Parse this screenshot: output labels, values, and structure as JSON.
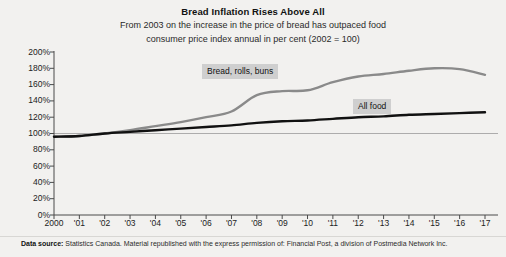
{
  "header": {
    "title": "Bread Inflation Rises Above All",
    "subtitle_line1": "From 2003 on the increase in the price of bread has outpaced food",
    "subtitle_line2": "consumer price index annual in per cent (2002 = 100)"
  },
  "footer": {
    "source_label": "Data source:",
    "source_text": " Statistics Canada. Material republished with the express permission of: Financial Post, a division of Postmedia Network Inc."
  },
  "labels": {
    "bread": "Bread, rolls, buns",
    "all_food": "All food"
  },
  "colors": {
    "background": "#f2f1ef",
    "bread_line": "#8a8a8a",
    "all_food_line": "#111111",
    "axis": "#4a4a4a",
    "gridline": "#9a9a9a",
    "label_box": "#cfcfcf",
    "text": "#1a1a1a"
  },
  "chart_data": {
    "type": "line",
    "title": "Bread Inflation Rises Above All",
    "subtitle": "From 2003 on the increase in the price of bread has outpaced food consumer price index annual in per cent (2002 = 100)",
    "xlabel": "",
    "ylabel": "",
    "xlim": [
      2000,
      2017
    ],
    "ylim": [
      0,
      200
    ],
    "ytick_values": [
      0,
      20,
      40,
      60,
      80,
      100,
      120,
      140,
      160,
      180,
      200
    ],
    "ytick_labels": [
      "0%",
      "20%",
      "40%",
      "60%",
      "80%",
      "100%",
      "120%",
      "140%",
      "160%",
      "180%",
      "200%"
    ],
    "x": [
      2000,
      2001,
      2002,
      2003,
      2004,
      2005,
      2006,
      2007,
      2008,
      2009,
      2010,
      2011,
      2012,
      2013,
      2014,
      2015,
      2016,
      2017
    ],
    "xtick_labels": [
      "2000",
      "'01",
      "'02",
      "'03",
      "'04",
      "'05",
      "'06",
      "'07",
      "'08",
      "'09",
      "'10",
      "'11",
      "'12",
      "'13",
      "'14",
      "'15",
      "'16",
      "'17"
    ],
    "grid": false,
    "reference_line": 100,
    "legend": "inline-annotations",
    "series": [
      {
        "name": "Bread, rolls, buns",
        "color": "#8a8a8a",
        "values": [
          96,
          97,
          100,
          104,
          109,
          114,
          120,
          127,
          147,
          152,
          153,
          163,
          170,
          173,
          177,
          180,
          179,
          172
        ]
      },
      {
        "name": "All food",
        "color": "#111111",
        "values": [
          96,
          97,
          100,
          102,
          104,
          106,
          108,
          110,
          113,
          115,
          116,
          118,
          120,
          121,
          123,
          124,
          125,
          126
        ]
      }
    ]
  }
}
